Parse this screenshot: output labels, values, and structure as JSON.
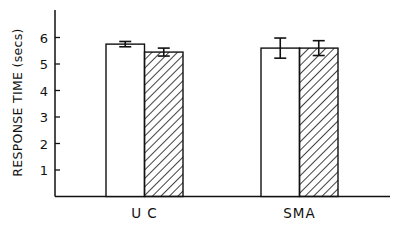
{
  "chart_data": {
    "type": "bar",
    "title": "",
    "xlabel": "",
    "ylabel": "RESPONSE TIME (secs)",
    "categories": [
      "UC",
      "SMA"
    ],
    "category_labels": [
      "U C",
      "SMA"
    ],
    "yticks": [
      1,
      2,
      3,
      4,
      5,
      6
    ],
    "ylim": [
      0,
      7.4
    ],
    "grid": false,
    "legend": null,
    "series": [
      {
        "name": "open",
        "fill": "white",
        "values": [
          5.75,
          5.6
        ],
        "errors": [
          0.1,
          0.38
        ]
      },
      {
        "name": "hatched",
        "fill": "hatched",
        "values": [
          5.45,
          5.6
        ],
        "errors": [
          0.15,
          0.28
        ]
      }
    ]
  },
  "colors": {
    "ink": "#111111",
    "background": "#ffffff"
  }
}
